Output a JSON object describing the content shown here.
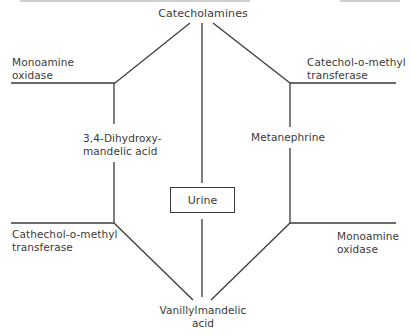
{
  "diagram": {
    "title_node": "Catecholamines",
    "center_node": "Urine",
    "end_node": {
      "line1": "Vanillylmandelic",
      "line2": "acid"
    },
    "left_branch": {
      "upper_enzyme": {
        "line1": "Monoamine",
        "line2": "oxidase"
      },
      "intermediate": {
        "line1": "3,4-Dihydroxy-",
        "line2": "mandelic acid"
      },
      "lower_enzyme": {
        "line1": "Cathechol-o-methyl",
        "line2": "transferase"
      }
    },
    "right_branch": {
      "upper_enzyme": {
        "line1": "Catechol-o-methyl",
        "line2": "transferase"
      },
      "intermediate": "Metanephrine",
      "lower_enzyme": {
        "line1": "Monoamine",
        "line2": "oxidase"
      }
    },
    "colors": {
      "line": "#3a3a3a",
      "text": "#3a3a3a",
      "background": "#ffffff"
    }
  }
}
